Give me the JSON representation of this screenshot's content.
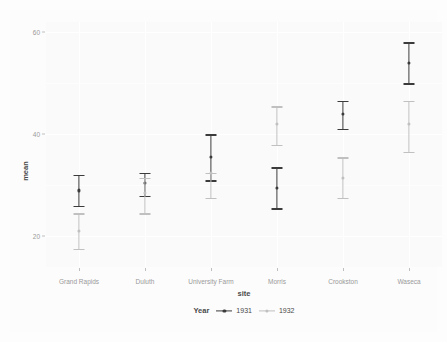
{
  "chart_data": {
    "type": "scatter",
    "title": "",
    "subtitle": "",
    "xlabel": "site",
    "ylabel": "mean",
    "categories": [
      "Grand Rapids",
      "Duluth",
      "University Farm",
      "Morris",
      "Crookston",
      "Waseca"
    ],
    "ylim": [
      14,
      62
    ],
    "yticks": [
      20,
      40,
      60
    ],
    "ytick_labels": [
      "20",
      "40",
      "60"
    ],
    "grid": true,
    "legend_position": "bottom",
    "legend_title": "Year",
    "series": [
      {
        "name": "1931",
        "color": "#3b3b3b",
        "values": [
          29.0,
          30.5,
          35.5,
          29.5,
          44.0,
          54.0
        ],
        "lower": [
          26.0,
          28.0,
          31.0,
          25.5,
          41.0,
          50.0
        ],
        "upper": [
          32.0,
          32.5,
          40.0,
          33.5,
          46.5,
          58.0
        ]
      },
      {
        "name": "1932",
        "color": "#c0c0c0",
        "values": [
          21.0,
          28.5,
          32.5,
          42.0,
          31.5,
          42.0
        ],
        "lower": [
          17.5,
          24.5,
          27.5,
          38.0,
          27.5,
          36.5
        ],
        "upper": [
          24.5,
          31.5,
          32.5,
          45.5,
          35.5,
          46.5
        ]
      }
    ]
  },
  "axis": {
    "y_title": "mean",
    "x_title": "site",
    "y_tick_labels": [
      "60",
      "40",
      "20"
    ],
    "x_tick_labels": [
      "Grand Rapids",
      "Duluth",
      "University Farm",
      "Morris",
      "Crookston",
      "Waseca"
    ]
  },
  "legend": {
    "title": "Year",
    "items": [
      {
        "label": "1931",
        "color": "#3b3b3b"
      },
      {
        "label": "1932",
        "color": "#c0c0c0"
      }
    ]
  },
  "colors": {
    "background": "#fdfdfd",
    "panel": "#fafafa",
    "gridline": "#ffffff",
    "axis_text": "#9a9a9a",
    "title_text": "#4a4a4a",
    "series_1931": "#3b3b3b",
    "series_1932": "#c0c0c0"
  }
}
